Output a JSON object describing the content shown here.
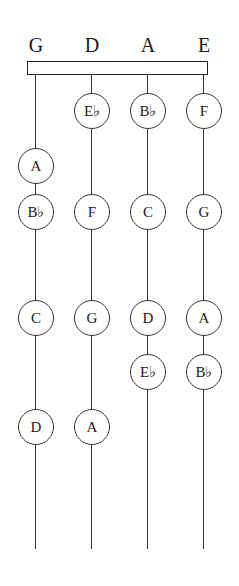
{
  "diagram": {
    "strings": [
      {
        "label": "G",
        "x": 36,
        "notes": [
          {
            "label": "A",
            "y": 166
          },
          {
            "label": "B♭",
            "y": 212
          },
          {
            "label": "C",
            "y": 318
          },
          {
            "label": "D",
            "y": 427
          }
        ]
      },
      {
        "label": "D",
        "x": 92,
        "notes": [
          {
            "label": "E♭",
            "y": 111
          },
          {
            "label": "F",
            "y": 212
          },
          {
            "label": "G",
            "y": 318
          },
          {
            "label": "A",
            "y": 427
          }
        ]
      },
      {
        "label": "A",
        "x": 148,
        "notes": [
          {
            "label": "B♭",
            "y": 111
          },
          {
            "label": "C",
            "y": 212
          },
          {
            "label": "D",
            "y": 318
          },
          {
            "label": "E♭",
            "y": 372
          }
        ]
      },
      {
        "label": "E",
        "x": 204,
        "notes": [
          {
            "label": "F",
            "y": 111
          },
          {
            "label": "G",
            "y": 212
          },
          {
            "label": "A",
            "y": 318
          },
          {
            "label": "B♭",
            "y": 372
          }
        ]
      }
    ],
    "string_top": 75,
    "string_bottom": 549
  }
}
